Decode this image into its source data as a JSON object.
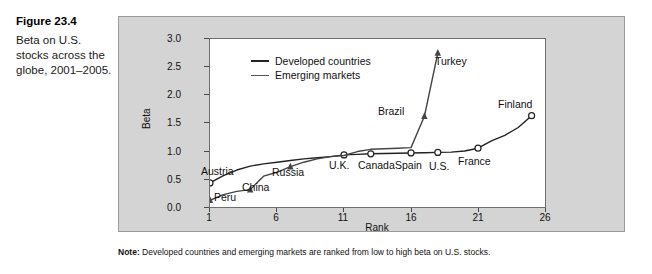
{
  "figure": {
    "number": "Figure 23.4",
    "caption": "Beta on U.S. stocks across the globe, 2001–2005."
  },
  "note": {
    "label": "Note:",
    "text": " Developed countries and emerging markets are ranked from low to high beta on U.S. stocks."
  },
  "chart_data": {
    "type": "line",
    "title": "Beta on U.S. stocks across the globe, 2001–2005.",
    "xlabel": "Rank",
    "ylabel": "Beta",
    "xlim": [
      1,
      26
    ],
    "ylim": [
      0.0,
      3.0
    ],
    "xticks": [
      "1",
      "6",
      "11",
      "16",
      "21",
      "26"
    ],
    "xtick_values": [
      1,
      6,
      11,
      16,
      21,
      26
    ],
    "yticks": [
      "0.0",
      "0.5",
      "1.0",
      "1.5",
      "2.0",
      "2.5",
      "3.0"
    ],
    "ytick_values": [
      0.0,
      0.5,
      1.0,
      1.5,
      2.0,
      2.5,
      3.0
    ],
    "grid": false,
    "legend_position": "top-left",
    "series": [
      {
        "name": "Developed countries",
        "marker": "open-circle",
        "color": "#222222",
        "x": [
          1,
          2,
          3,
          4,
          5,
          6,
          7,
          8,
          9,
          10,
          11,
          12,
          13,
          14,
          15,
          16,
          17,
          18,
          19,
          20,
          21,
          22,
          23,
          24,
          25
        ],
        "y": [
          0.43,
          0.56,
          0.66,
          0.73,
          0.77,
          0.8,
          0.83,
          0.86,
          0.88,
          0.9,
          0.93,
          0.94,
          0.95,
          0.955,
          0.96,
          0.965,
          0.97,
          0.975,
          0.98,
          1.0,
          1.05,
          1.18,
          1.28,
          1.42,
          1.63
        ]
      },
      {
        "name": "Emerging markets",
        "marker": "filled-triangle",
        "color": "#444444",
        "x": [
          1,
          2,
          3,
          4,
          5,
          6,
          7,
          8,
          9,
          10,
          11,
          12,
          13,
          14,
          15,
          16,
          17,
          18
        ],
        "y": [
          0.12,
          0.22,
          0.28,
          0.31,
          0.55,
          0.62,
          0.72,
          0.8,
          0.86,
          0.9,
          0.92,
          0.99,
          1.03,
          1.04,
          1.05,
          1.06,
          1.62,
          2.75
        ]
      }
    ],
    "annotations": [
      {
        "label": "Austria",
        "series": "Developed countries",
        "x": 1,
        "y": 0.43
      },
      {
        "label": "U.K.",
        "series": "Developed countries",
        "x": 11,
        "y": 0.93
      },
      {
        "label": "Canada",
        "series": "Developed countries",
        "x": 13,
        "y": 0.95
      },
      {
        "label": "Spain",
        "series": "Developed countries",
        "x": 16,
        "y": 0.965
      },
      {
        "label": "U.S.",
        "series": "Developed countries",
        "x": 18,
        "y": 0.975
      },
      {
        "label": "France",
        "series": "Developed countries",
        "x": 21,
        "y": 1.05
      },
      {
        "label": "Finland",
        "series": "Developed countries",
        "x": 25,
        "y": 1.63
      },
      {
        "label": "Peru",
        "series": "Emerging markets",
        "x": 1,
        "y": 0.12
      },
      {
        "label": "China",
        "series": "Emerging markets",
        "x": 4,
        "y": 0.31
      },
      {
        "label": "Russia",
        "series": "Emerging markets",
        "x": 7,
        "y": 0.72
      },
      {
        "label": "Brazil",
        "series": "Emerging markets",
        "x": 17,
        "y": 1.62
      },
      {
        "label": "Turkey",
        "series": "Emerging markets",
        "x": 18,
        "y": 2.75
      }
    ]
  },
  "axis": {
    "y_title": "Beta",
    "x_title": "Rank",
    "yticks": [
      "3.0",
      "2.5",
      "2.0",
      "1.5",
      "1.0",
      "0.5",
      "0.0"
    ],
    "xticks": [
      "1",
      "6",
      "11",
      "16",
      "21",
      "26"
    ]
  },
  "legend": {
    "items": [
      {
        "label": "Developed countries"
      },
      {
        "label": "Emerging markets"
      }
    ]
  },
  "labels": {
    "austria": "Austria",
    "peru": "Peru",
    "china": "China",
    "russia": "Russia",
    "uk": "U.K.",
    "canada": "Canada",
    "spain": "Spain",
    "us": "U.S.",
    "france": "France",
    "finland": "Finland",
    "brazil": "Brazil",
    "turkey": "Turkey"
  },
  "colors": {
    "panel_bg": "#d4d4d4",
    "plot_bg": "#ffffff",
    "developed_line": "#222222",
    "emerging_line": "#444444",
    "axis": "#4a4a4a"
  }
}
